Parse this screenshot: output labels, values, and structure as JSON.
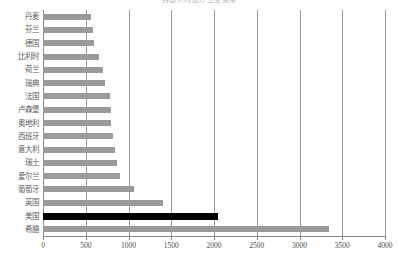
{
  "chart_data": {
    "type": "bar",
    "orientation": "horizontal",
    "title": "各国人均医疗卫生费用",
    "xlabel": "",
    "ylabel": "",
    "xlim": [
      0,
      4000
    ],
    "xticks": [
      0,
      500,
      1000,
      1500,
      2000,
      2500,
      3000,
      3500,
      4000
    ],
    "xtick_labels": [
      "0",
      "500",
      "1000",
      "1500",
      "2000",
      "2500",
      "3000",
      "3500",
      "4000"
    ],
    "grid": true,
    "grid_axis": "x",
    "legend": "none",
    "bar_color": "#9a9a9a",
    "highlight_color": "#000000",
    "highlight_category": "美国",
    "categories": [
      "丹麦",
      "芬兰",
      "德国",
      "比利时",
      "荷兰",
      "瑞典",
      "法国",
      "卢森堡",
      "奥地利",
      "西班牙",
      "意大利",
      "瑞士",
      "爱尔兰",
      "葡萄牙",
      "英国",
      "美国",
      "希腊"
    ],
    "values": [
      560,
      580,
      600,
      650,
      700,
      720,
      780,
      790,
      800,
      820,
      840,
      860,
      900,
      1070,
      1400,
      2050,
      3350
    ],
    "bars": [
      {
        "category": "丹麦",
        "value": 560,
        "highlight": false
      },
      {
        "category": "芬兰",
        "value": 580,
        "highlight": false
      },
      {
        "category": "德国",
        "value": 600,
        "highlight": false
      },
      {
        "category": "比利时",
        "value": 650,
        "highlight": false
      },
      {
        "category": "荷兰",
        "value": 700,
        "highlight": false
      },
      {
        "category": "瑞典",
        "value": 720,
        "highlight": false
      },
      {
        "category": "法国",
        "value": 780,
        "highlight": false
      },
      {
        "category": "卢森堡",
        "value": 790,
        "highlight": false
      },
      {
        "category": "奥地利",
        "value": 800,
        "highlight": false
      },
      {
        "category": "西班牙",
        "value": 820,
        "highlight": false
      },
      {
        "category": "意大利",
        "value": 840,
        "highlight": false
      },
      {
        "category": "瑞士",
        "value": 860,
        "highlight": false
      },
      {
        "category": "爱尔兰",
        "value": 900,
        "highlight": false
      },
      {
        "category": "葡萄牙",
        "value": 1070,
        "highlight": false
      },
      {
        "category": "英国",
        "value": 1400,
        "highlight": false
      },
      {
        "category": "美国",
        "value": 2050,
        "highlight": true
      },
      {
        "category": "希腊",
        "value": 3350,
        "highlight": false
      }
    ]
  }
}
